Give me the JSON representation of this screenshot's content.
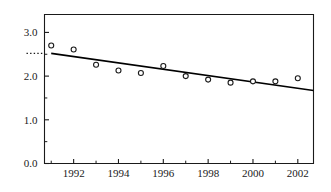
{
  "chart_data": {
    "type": "scatter",
    "title": "",
    "xlabel": "",
    "ylabel": "",
    "x": [
      1991,
      1992,
      1993,
      1994,
      1995,
      1996,
      1997,
      1998,
      1999,
      2000,
      2001,
      2002
    ],
    "values": [
      2.7,
      2.61,
      2.26,
      2.13,
      2.07,
      2.23,
      2.0,
      1.92,
      1.85,
      1.88,
      1.88,
      1.95
    ],
    "series": [
      {
        "name": "observations",
        "marker": "open-circle",
        "values": [
          2.7,
          2.61,
          2.26,
          2.13,
          2.07,
          2.23,
          2.0,
          1.92,
          1.85,
          1.88,
          1.88,
          1.95
        ]
      },
      {
        "name": "trend-line",
        "marker": "line",
        "x": [
          1991,
          2002.7
        ],
        "values": [
          2.52,
          1.67
        ]
      }
    ],
    "xlim": [
      1990.7,
      2002.7
    ],
    "ylim": [
      0.0,
      3.41
    ],
    "xticks": [
      1992,
      1994,
      1996,
      1998,
      2000,
      2002
    ],
    "xtick_labels": [
      "1992",
      "1994",
      "1996",
      "1998",
      "2000",
      "2002"
    ],
    "xminor_ticks": [
      1991,
      1993,
      1995,
      1997,
      1999,
      2001
    ],
    "yticks": [
      0.0,
      1.0,
      2.0,
      3.0
    ],
    "ytick_labels": [
      "0.0",
      "1.0",
      "2.0",
      "3.0"
    ],
    "yminor_ticks": [
      0.5,
      1.5,
      2.5
    ],
    "grid": false,
    "legend": false,
    "annotations": [
      {
        "name": "intercept-dotted-marker",
        "y": 2.52,
        "style": "dotted",
        "label": ""
      }
    ],
    "colors": {
      "axis": "#1a1a1a",
      "marker": "#1a1a1a",
      "trend_line": "#000000",
      "background": "#ffffff"
    }
  }
}
